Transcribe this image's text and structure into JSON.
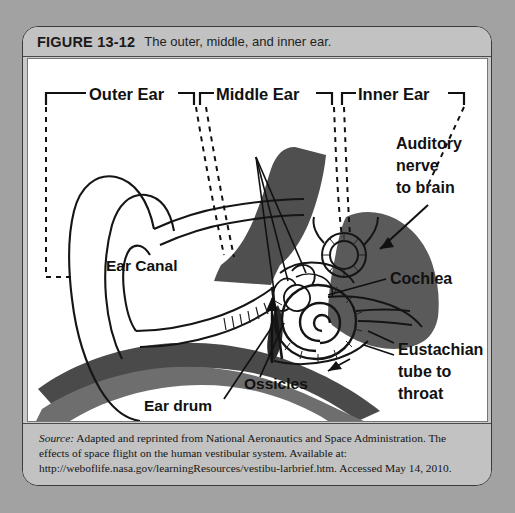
{
  "figure": {
    "number": "FIGURE 13-12",
    "title": "The outer, middle, and inner ear.",
    "source_label": "Source:",
    "source_text": " Adapted and reprinted from National Aeronautics and Space Administration. The effects of space flight on the human vestibular system. Available at: http://weboflife.nasa.gov/learningResources/vestibu-larbrief.htm. Accessed May 14, 2010."
  },
  "diagram": {
    "type": "anatomical-illustration",
    "region_labels": [
      {
        "id": "outer-ear",
        "text": "Outer Ear"
      },
      {
        "id": "middle-ear",
        "text": "Middle Ear"
      },
      {
        "id": "inner-ear",
        "text": "Inner Ear"
      }
    ],
    "part_labels": [
      {
        "id": "auditory-nerve",
        "line1": "Auditory",
        "line2": "nerve",
        "line3": "to brain"
      },
      {
        "id": "cochlea",
        "text": "Cochlea"
      },
      {
        "id": "eustachian-tube",
        "line1": "Eustachian",
        "line2": "tube to",
        "line3": "throat"
      },
      {
        "id": "ear-canal",
        "text": "Ear Canal"
      },
      {
        "id": "ossicles",
        "text": "Ossicles"
      },
      {
        "id": "ear-drum",
        "text": "Ear drum"
      }
    ],
    "colors": {
      "ink": "#111111",
      "dark_shade": "#4a4a4a",
      "mid_shade": "#6f6f6f",
      "panel": "#ffffff",
      "frame": "#c2c2c2"
    }
  }
}
